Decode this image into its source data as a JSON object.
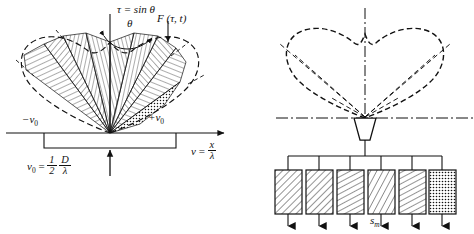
{
  "figure": {
    "name": "beam-pattern-and-transducer-array-diagram",
    "ink_color": "#111111",
    "background": "#ffffff"
  },
  "left_panel": {
    "name": "directivity-pattern-panel",
    "tau_label": "τ = sin θ",
    "theta_label": "θ",
    "function_label": "F (τ, t)",
    "tick_minus": "−v",
    "tick_minus_sub": "0",
    "tick_plus": "+v",
    "tick_plus_sub": "0",
    "axis_label_lhs": "v",
    "axis_label_eq": " = ",
    "axis_frac_num": "x",
    "axis_frac_den": "λ",
    "v0_lhs": "v",
    "v0_lhs_sub": "0",
    "v0_eq": " = ",
    "v0_half_num": "1",
    "v0_half_den": "2",
    "v0_ratio_num": "D",
    "v0_ratio_den": "λ",
    "sector_fills": [
      "hatch-steep-left",
      "hatch-diag-left",
      "hatch-vertical",
      "hatch-horizontal",
      "hatch-diag-right",
      "hatch-steep-right",
      "dots-stipple"
    ]
  },
  "right_panel": {
    "name": "transducer-array-panel",
    "cardioid_style": "dashed",
    "axis_style": "dash-dot",
    "horn_label": "transducer-horn",
    "sm_label": "s",
    "sm_label_sub": "m",
    "delay_boxes": [
      {
        "name": "delay-box-1",
        "fill": "hatch-a"
      },
      {
        "name": "delay-box-2",
        "fill": "hatch-a"
      },
      {
        "name": "delay-box-3",
        "fill": "hatch-shallow"
      },
      {
        "name": "delay-box-4",
        "fill": "hatch-steep"
      },
      {
        "name": "delay-box-5",
        "fill": "hatch-shallow"
      },
      {
        "name": "delay-box-6",
        "fill": "dots"
      }
    ]
  }
}
